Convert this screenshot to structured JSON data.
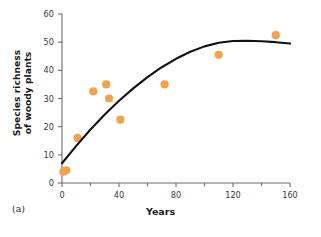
{
  "figure": {
    "panel_label": "(a)",
    "point_color": "#F2A24B",
    "curve_color": "#111111",
    "axis_color": "#6b6b6b"
  },
  "chart_data": {
    "type": "scatter",
    "title": "",
    "xlabel": "Years",
    "ylabel": "Species richness of woody plants",
    "ylabel_line1": "Species richness",
    "ylabel_line2": "of woody plants",
    "xlim": [
      0,
      160
    ],
    "ylim": [
      0,
      60
    ],
    "xticks": [
      0,
      40,
      80,
      120,
      160
    ],
    "xticklabels": [
      "0",
      "40",
      "80",
      "120",
      "160"
    ],
    "xminorticks": [
      20,
      60,
      100,
      140
    ],
    "yticks": [
      0,
      10,
      20,
      30,
      40,
      50,
      60
    ],
    "yticklabels": [
      "0",
      "10",
      "20",
      "30",
      "40",
      "50",
      "60"
    ],
    "grid": false,
    "legend": null,
    "series": [
      {
        "name": "Observed plots",
        "type": "scatter",
        "marker": "circle",
        "color": "#F2A24B",
        "x": [
          1,
          3,
          11,
          22,
          31,
          33,
          41,
          72,
          110,
          150
        ],
        "y": [
          4,
          4.5,
          16,
          32.5,
          35,
          30,
          22.5,
          35,
          45.5,
          52.5
        ]
      },
      {
        "name": "Fitted curve",
        "type": "line",
        "color": "#111111",
        "x": [
          0,
          10,
          20,
          30,
          40,
          50,
          60,
          70,
          80,
          90,
          100,
          110,
          120,
          130,
          140,
          150,
          160
        ],
        "y": [
          7,
          13.2,
          19.0,
          24.3,
          29.2,
          33.6,
          37.6,
          41.1,
          44.1,
          46.6,
          48.5,
          49.8,
          50.4,
          50.5,
          50.3,
          50.0,
          49.5
        ]
      }
    ]
  }
}
